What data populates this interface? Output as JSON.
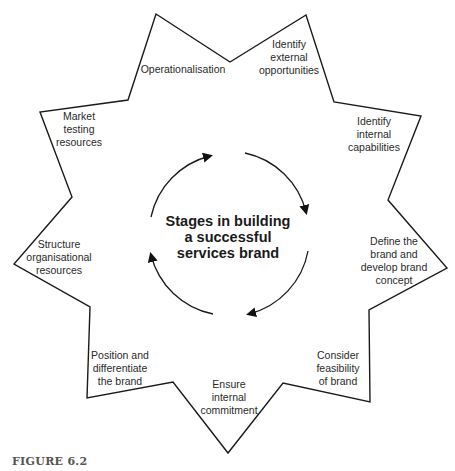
{
  "figure": {
    "caption": "FIGURE 6.2",
    "center_title": [
      "Stages in building",
      "a successful",
      "services brand"
    ],
    "cycle_direction": "clockwise",
    "stages": [
      {
        "id": "identify-external-opportunities",
        "lines": [
          "Identify",
          "external",
          "opportunities"
        ]
      },
      {
        "id": "identify-internal-capabilities",
        "lines": [
          "Identify",
          "internal",
          "capabilities"
        ]
      },
      {
        "id": "define-brand",
        "lines": [
          "Define the",
          "brand and",
          "develop brand",
          "concept"
        ]
      },
      {
        "id": "consider-feasibility",
        "lines": [
          "Consider",
          "feasibility",
          "of brand"
        ]
      },
      {
        "id": "ensure-internal-commitment",
        "lines": [
          "Ensure",
          "internal",
          "commitment"
        ]
      },
      {
        "id": "position-differentiate",
        "lines": [
          "Position and",
          "differentiate",
          "the brand"
        ]
      },
      {
        "id": "structure-resources",
        "lines": [
          "Structure",
          "organisational",
          "resources"
        ]
      },
      {
        "id": "market-testing",
        "lines": [
          "Market",
          "testing",
          "resources"
        ]
      },
      {
        "id": "operationalisation",
        "lines": [
          "Operationalisation"
        ]
      }
    ]
  }
}
